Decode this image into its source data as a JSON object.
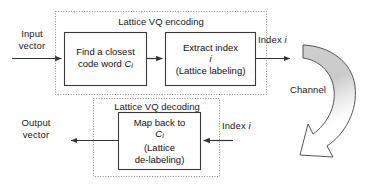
{
  "diagram": {
    "groups": [
      {
        "id": "encoding",
        "label": "Lattice VQ encoding"
      },
      {
        "id": "decoding",
        "label": "Lattice VQ decoding"
      }
    ],
    "blocks": [
      {
        "id": "find-closest-code-word",
        "lines": [
          "Find a closest",
          "code word C"
        ],
        "subscript": "i",
        "line1": "Find a closest",
        "line2_prefix": "code word ",
        "line2_var": "C",
        "line2_sub": "i"
      },
      {
        "id": "extract-index",
        "line1": "Extract index",
        "line2_var": "i",
        "line3": "(Lattice labeling)"
      },
      {
        "id": "map-back-to-ci",
        "line1": "Map back to",
        "line2_var": "C",
        "line2_sub": "i",
        "line3": "(Lattice",
        "line4": "de-labeling)"
      }
    ],
    "labels": {
      "input_vector": "Input\nvector",
      "output_vector": "Output\nvector",
      "index_top_prefix": "Index ",
      "index_top_var": "i",
      "index_bottom_prefix": "Index ",
      "index_bottom_var": "i",
      "channel": "Channel"
    },
    "colors": {
      "stroke": "#333333",
      "dotted": "#8a8a8a",
      "channel_fill_top": "#c9c9c9",
      "channel_fill_bottom": "#ffffff",
      "text": "#1a1a1a",
      "background": "#ffffff"
    }
  }
}
